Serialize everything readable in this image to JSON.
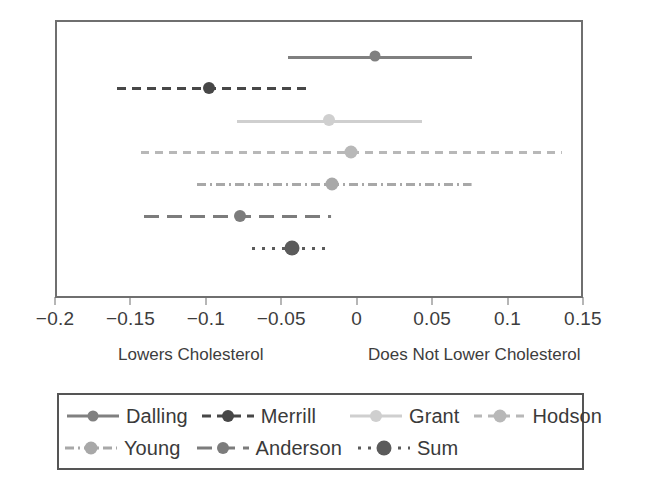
{
  "chart_data": {
    "type": "scatter",
    "subtype": "forest-plot",
    "title": "",
    "xlabel": "",
    "ylabel": "",
    "xlim": [
      -0.2,
      0.15
    ],
    "grid": false,
    "legend_position": "bottom",
    "xticks": [
      -0.2,
      -0.15,
      -0.1,
      -0.05,
      0,
      0.05,
      0.1,
      0.15
    ],
    "xticklabels": [
      "−0.2",
      "−0.15",
      "−0.1",
      "−0.05",
      "0",
      "0.05",
      "0.1",
      "0.15"
    ],
    "annotations": [
      {
        "text": "Lowers Cholesterol",
        "side": "left"
      },
      {
        "text": "Does Not Lower Cholesterol",
        "side": "right"
      }
    ],
    "series": [
      {
        "name": "Dalling",
        "estimate": 0.011,
        "ci_low": -0.047,
        "ci_high": 0.075,
        "color": "#808080",
        "line_style": "solid",
        "dash": "none",
        "marker_size": 11
      },
      {
        "name": "Merrill",
        "estimate": -0.099,
        "ci_low": -0.16,
        "ci_high": -0.034,
        "color": "#474747",
        "line_style": "dashed",
        "dash": "9 6",
        "marker_size": 12
      },
      {
        "name": "Grant",
        "estimate": -0.02,
        "ci_low": -0.081,
        "ci_high": 0.042,
        "color": "#cfcfcf",
        "line_style": "solid",
        "dash": "none",
        "marker_size": 12
      },
      {
        "name": "Hodson",
        "estimate": -0.005,
        "ci_low": -0.144,
        "ci_high": 0.135,
        "color": "#b8b8b8",
        "line_style": "dashed",
        "dash": "8 6",
        "marker_size": 13
      },
      {
        "name": "Young",
        "estimate": -0.018,
        "ci_low": -0.107,
        "ci_high": 0.075,
        "color": "#a8a8a8",
        "line_style": "dashdot",
        "dash": "9 4 2 4",
        "marker_size": 13
      },
      {
        "name": "Anderson",
        "estimate": -0.079,
        "ci_low": -0.142,
        "ci_high": -0.018,
        "color": "#7c7c7c",
        "line_style": "longdash",
        "dash": "15 8",
        "marker_size": 12
      },
      {
        "name": "Sum",
        "estimate": -0.044,
        "ci_low": -0.071,
        "ci_high": -0.018,
        "color": "#5b5b5b",
        "line_style": "dotted",
        "dash": "3 7",
        "marker_size": 15
      }
    ]
  },
  "axis": {
    "left_caption": "Lowers Cholesterol",
    "right_caption": "Does Not Lower Cholesterol",
    "tick_labels": [
      "−0.2",
      "−0.15",
      "−0.1",
      "−0.05",
      "0",
      "0.05",
      "0.1",
      "0.15"
    ]
  },
  "legend": {
    "rows": [
      [
        "Dalling",
        "Merrill",
        "Grant",
        "Hodson"
      ],
      [
        "Young",
        "Anderson",
        "Sum"
      ]
    ],
    "entries": [
      {
        "label": "Dalling",
        "color": "#808080",
        "dash": "none",
        "marker_size": 11
      },
      {
        "label": "Merrill",
        "color": "#474747",
        "dash": "9 6",
        "marker_size": 12
      },
      {
        "label": "Grant",
        "color": "#cfcfcf",
        "dash": "none",
        "marker_size": 12
      },
      {
        "label": "Hodson",
        "color": "#b8b8b8",
        "dash": "8 6",
        "marker_size": 13
      },
      {
        "label": "Young",
        "color": "#a8a8a8",
        "dash": "9 4 2 4",
        "marker_size": 13
      },
      {
        "label": "Anderson",
        "color": "#7c7c7c",
        "dash": "15 8",
        "marker_size": 12
      },
      {
        "label": "Sum",
        "color": "#5b5b5b",
        "dash": "3 7",
        "marker_size": 15
      }
    ]
  },
  "colors": {
    "frame": "#6f6f6f",
    "axis": "#6f6f6f",
    "text": "#3d3d3d",
    "legend_border": "#555555",
    "background": "#ffffff"
  }
}
